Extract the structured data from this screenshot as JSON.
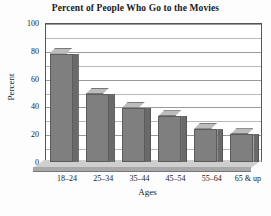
{
  "chart_data": {
    "type": "bar",
    "title": "Percent of People Who Go to the Movies",
    "xlabel": "Ages",
    "ylabel": "Percent",
    "categories": [
      "18–24",
      "25–34",
      "35–44",
      "45–54",
      "55–64",
      "65 & up"
    ],
    "values": [
      78,
      49,
      39,
      33,
      24,
      20
    ],
    "ylim": [
      0,
      100
    ],
    "ytick_labels": [
      "0",
      "20",
      "40",
      "60",
      "80",
      "100"
    ],
    "ytick_values": [
      0,
      20,
      40,
      60,
      80,
      100
    ],
    "minor_gridline_values": [
      10,
      30,
      50,
      70,
      90
    ],
    "grid": true,
    "legend": false,
    "style": "3d-column",
    "colors": {
      "bar_front": "#7f7f7f",
      "bar_top": "#bcbcbc",
      "bar_side": "#6a6a6a",
      "gridline": "#b9b9b9",
      "axis": "#555555",
      "floor_surface": "#cfcfcf",
      "floor_face": "#a9a9a9",
      "text": "#1a1a1a",
      "background": "#fdfdfd"
    }
  }
}
